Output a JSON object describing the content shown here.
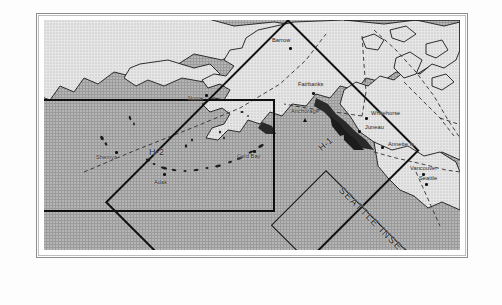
{
  "document": {
    "type": "map-figure",
    "region": "Alaska and Northwest North America",
    "frame": {
      "outer_border_color": "#8d8d8d",
      "inner_border_color": "#bdbdbd",
      "background": "#ffffff"
    }
  },
  "map": {
    "ocean_color": "#9b9b9b",
    "land_color": "#e4e4e4",
    "coast_line_color": "#1a1a1a",
    "boundary_line_style": "dashed",
    "boundary_line_color": "#3a3a3a",
    "survey_box_color": "#101010"
  },
  "survey_areas": [
    {
      "id": "h2",
      "label": "H-2",
      "shape": "rectangle",
      "rotation_deg": 0
    },
    {
      "id": "h1",
      "label": "H-1",
      "shape": "rectangle",
      "rotation_deg": -44
    },
    {
      "id": "seattle-inset",
      "label": "SEATTLE INSET",
      "shape": "rectangle",
      "rotation_deg": -44
    }
  ],
  "cities": [
    {
      "name": "Barrow",
      "marker": "dot"
    },
    {
      "name": "Nome",
      "marker": "dot"
    },
    {
      "name": "Fairbanks",
      "marker": "dot"
    },
    {
      "name": "Anchorage",
      "marker": "triangle"
    },
    {
      "name": "Whitehorse",
      "marker": "dot"
    },
    {
      "name": "Juneau",
      "marker": "dot"
    },
    {
      "name": "Annette Is.",
      "marker": "dot"
    },
    {
      "name": "Vancouver",
      "marker": "dot"
    },
    {
      "name": "Seattle",
      "marker": "dot"
    },
    {
      "name": "Shemya",
      "marker": "dot"
    },
    {
      "name": "Adak",
      "marker": "dot"
    },
    {
      "name": "Cold Bay",
      "marker": "dot"
    }
  ],
  "labels": {
    "barrow": "Barrow",
    "nome": "Nome",
    "fairbanks": "Fairbanks",
    "anchorage": "Anchorage",
    "whitehorse": "Whitehorse",
    "juneau": "Juneau",
    "annette": "Annette Is.",
    "vancouver": "Vancouver",
    "seattle": "Seattle",
    "shemya": "Shemya",
    "adak": "Adak",
    "coldbay": "Cold Bay",
    "h1": "H-1",
    "h2": "H-2",
    "seattle_inset": "SEATTLE INSET"
  }
}
